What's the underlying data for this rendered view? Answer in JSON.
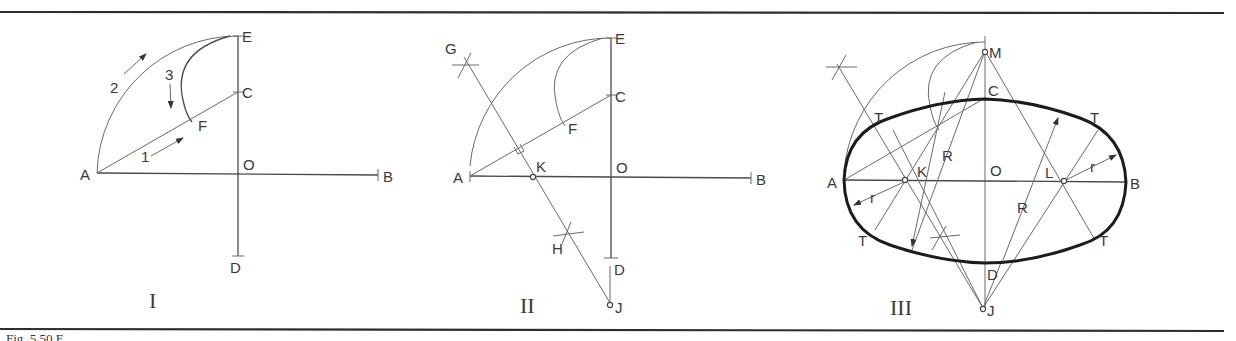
{
  "figure": {
    "caption_partial": "Fig. 5.50  E",
    "panels": [
      {
        "id": "I",
        "numeral": "I",
        "labels": {
          "A": "A",
          "B": "B",
          "C": "C",
          "D": "D",
          "E": "E",
          "F": "F",
          "O": "O"
        },
        "step_labels": {
          "step1": "1",
          "step2": "2",
          "step3": "3"
        }
      },
      {
        "id": "II",
        "numeral": "II",
        "labels": {
          "A": "A",
          "B": "B",
          "C": "C",
          "D": "D",
          "E": "E",
          "F": "F",
          "O": "O",
          "G": "G",
          "H": "H",
          "K": "K",
          "J": "J"
        }
      },
      {
        "id": "III",
        "numeral": "III",
        "labels": {
          "A": "A",
          "B": "B",
          "C": "C",
          "D": "D",
          "O": "O",
          "M": "M",
          "K": "K",
          "L": "L",
          "J": "J",
          "T1": "T",
          "T2": "T",
          "T3": "T",
          "T4": "T",
          "R1": "R",
          "R2": "R",
          "r1": "r",
          "r2": "r"
        }
      }
    ],
    "colors": {
      "ink": "#3a3a3a",
      "ellipse": "#1c1c1c",
      "rule": "#2e2e2e",
      "background": "#ffffff"
    }
  }
}
